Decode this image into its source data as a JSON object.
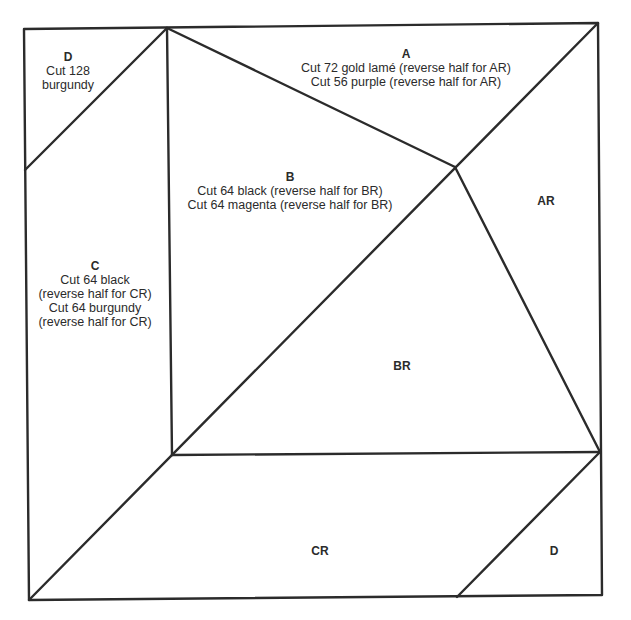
{
  "diagram": {
    "type": "quilt-block-pattern",
    "pieces": [
      {
        "id": "A",
        "label": "A",
        "instructions": [
          "Cut 72 gold lamé (reverse half for AR)",
          "Cut 56 purple (reverse half for AR)"
        ]
      },
      {
        "id": "AR",
        "label": "AR",
        "instructions": []
      },
      {
        "id": "B",
        "label": "B",
        "instructions": [
          "Cut 64 black (reverse half for BR)",
          "Cut 64 magenta (reverse half for BR)"
        ]
      },
      {
        "id": "BR",
        "label": "BR",
        "instructions": []
      },
      {
        "id": "C",
        "label": "C",
        "instructions": [
          "Cut 64 black",
          "(reverse half for CR)",
          "Cut 64 burgundy",
          "(reverse half for CR)"
        ]
      },
      {
        "id": "CR",
        "label": "CR",
        "instructions": []
      },
      {
        "id": "D-top",
        "label": "D",
        "instructions": [
          "Cut 128",
          "burgundy"
        ]
      },
      {
        "id": "D-bottom",
        "label": "D",
        "instructions": []
      }
    ],
    "colors": {
      "line": "#2b2b2b",
      "background": "#ffffff",
      "text": "#2b2b2b"
    }
  }
}
